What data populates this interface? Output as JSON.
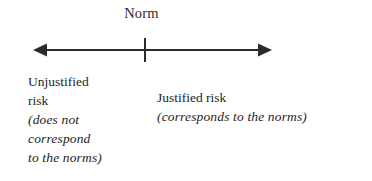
{
  "diagram": {
    "title_label": "Norm",
    "axis": {
      "orientation": "horizontal",
      "left_arrowhead": "arrow-left-icon",
      "right_arrowhead": "arrow-right-icon",
      "center_tick": "norm-tick-mark",
      "stroke_color": "#2a2a2a",
      "x_start": 33,
      "x_end": 272,
      "y": 50,
      "tick_x": 145,
      "tick_top": 38,
      "tick_bottom": 62
    },
    "left_side": {
      "heading_lines": [
        "Unjustified",
        "risk"
      ],
      "detail_lines": [
        "(does not",
        "correspond",
        "to the norms)"
      ]
    },
    "right_side": {
      "heading_lines": [
        "Justified risk"
      ],
      "detail_lines": [
        "(corresponds to the norms)"
      ]
    }
  },
  "colors": {
    "background": "#ffffff",
    "ink": "#1e1e1e",
    "axis": "#2a2a2a"
  }
}
